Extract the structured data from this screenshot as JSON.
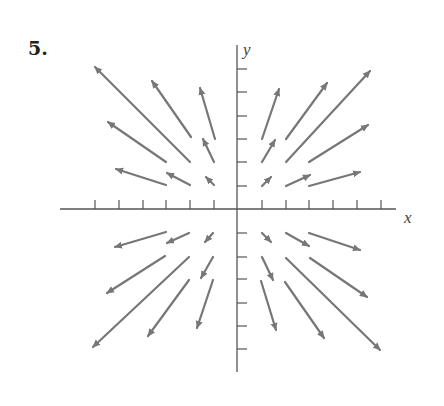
{
  "problem": {
    "number": "5."
  },
  "axes": {
    "x_label": "x",
    "y_label": "y",
    "color": "#555555",
    "origin_px": [
      237,
      209
    ],
    "x_axis_px": [
      60,
      396
    ],
    "y_axis_px": [
      45,
      372
    ],
    "x_ticks_px": [
      95,
      119,
      143,
      166,
      190,
      214,
      262,
      286,
      309,
      333,
      357,
      381
    ],
    "y_ticks_px": [
      69,
      92,
      116,
      139,
      162,
      186,
      233,
      257,
      279,
      303,
      326,
      349
    ]
  },
  "arrow_color": "#777777",
  "chart_data": {
    "type": "vector_field",
    "title": "5.",
    "xlabel": "x",
    "ylabel": "y",
    "grid_points": "integer lattice points with |x|,|y| in {1,2,3}, excluding (±3,±3)",
    "vectors": [
      {
        "at": [
          1,
          1
        ],
        "from_px": [
          262,
          186
        ],
        "to_px": [
          271,
          177
        ]
      },
      {
        "at": [
          2,
          1
        ],
        "from_px": [
          286,
          186
        ],
        "to_px": [
          310,
          175
        ]
      },
      {
        "at": [
          3,
          1
        ],
        "from_px": [
          309,
          186
        ],
        "to_px": [
          360,
          172
        ]
      },
      {
        "at": [
          1,
          2
        ],
        "from_px": [
          262,
          162
        ],
        "to_px": [
          275,
          140
        ]
      },
      {
        "at": [
          2,
          2
        ],
        "from_px": [
          286,
          162
        ],
        "to_px": [
          370,
          71
        ]
      },
      {
        "at": [
          3,
          2
        ],
        "from_px": [
          309,
          162
        ],
        "to_px": [
          368,
          125
        ]
      },
      {
        "at": [
          1,
          3
        ],
        "from_px": [
          262,
          139
        ],
        "to_px": [
          279,
          89
        ]
      },
      {
        "at": [
          2,
          3
        ],
        "from_px": [
          286,
          139
        ],
        "to_px": [
          327,
          83
        ]
      },
      {
        "at": [
          -1,
          1
        ],
        "from_px": [
          214,
          185
        ],
        "to_px": [
          206,
          177
        ]
      },
      {
        "at": [
          -2,
          1
        ],
        "from_px": [
          190,
          185
        ],
        "to_px": [
          167,
          173
        ]
      },
      {
        "at": [
          -3,
          1
        ],
        "from_px": [
          166,
          185
        ],
        "to_px": [
          116,
          169
        ]
      },
      {
        "at": [
          -1,
          2
        ],
        "from_px": [
          214,
          162
        ],
        "to_px": [
          203,
          139
        ]
      },
      {
        "at": [
          -2,
          2
        ],
        "from_px": [
          190,
          162
        ],
        "to_px": [
          95,
          67
        ]
      },
      {
        "at": [
          -3,
          2
        ],
        "from_px": [
          166,
          162
        ],
        "to_px": [
          108,
          122
        ]
      },
      {
        "at": [
          -1,
          3
        ],
        "from_px": [
          215,
          139
        ],
        "to_px": [
          200,
          88
        ]
      },
      {
        "at": [
          -2,
          3
        ],
        "from_px": [
          191,
          137
        ],
        "to_px": [
          152,
          81
        ]
      },
      {
        "at": [
          -1,
          -1
        ],
        "from_px": [
          213,
          233
        ],
        "to_px": [
          205,
          242
        ]
      },
      {
        "at": [
          -2,
          -1
        ],
        "from_px": [
          189,
          233
        ],
        "to_px": [
          167,
          243
        ]
      },
      {
        "at": [
          -3,
          -1
        ],
        "from_px": [
          166,
          232
        ],
        "to_px": [
          115,
          247
        ]
      },
      {
        "at": [
          -1,
          -2
        ],
        "from_px": [
          213,
          257
        ],
        "to_px": [
          201,
          278
        ]
      },
      {
        "at": [
          -2,
          -2
        ],
        "from_px": [
          189,
          257
        ],
        "to_px": [
          93,
          347
        ]
      },
      {
        "at": [
          -3,
          -2
        ],
        "from_px": [
          165,
          256
        ],
        "to_px": [
          107,
          293
        ]
      },
      {
        "at": [
          -1,
          -3
        ],
        "from_px": [
          213,
          280
        ],
        "to_px": [
          197,
          328
        ]
      },
      {
        "at": [
          -2,
          -3
        ],
        "from_px": [
          189,
          280
        ],
        "to_px": [
          148,
          336
        ]
      },
      {
        "at": [
          1,
          -1
        ],
        "from_px": [
          262,
          233
        ],
        "to_px": [
          271,
          242
        ]
      },
      {
        "at": [
          2,
          -1
        ],
        "from_px": [
          286,
          233
        ],
        "to_px": [
          309,
          246
        ]
      },
      {
        "at": [
          3,
          -1
        ],
        "from_px": [
          309,
          233
        ],
        "to_px": [
          360,
          250
        ]
      },
      {
        "at": [
          1,
          -2
        ],
        "from_px": [
          262,
          257
        ],
        "to_px": [
          273,
          280
        ]
      },
      {
        "at": [
          2,
          -2
        ],
        "from_px": [
          286,
          258
        ],
        "to_px": [
          380,
          350
        ]
      },
      {
        "at": [
          3,
          -2
        ],
        "from_px": [
          310,
          258
        ],
        "to_px": [
          367,
          297
        ]
      },
      {
        "at": [
          1,
          -3
        ],
        "from_px": [
          261,
          281
        ],
        "to_px": [
          276,
          330
        ]
      },
      {
        "at": [
          2,
          -3
        ],
        "from_px": [
          285,
          282
        ],
        "to_px": [
          324,
          338
        ]
      }
    ]
  }
}
